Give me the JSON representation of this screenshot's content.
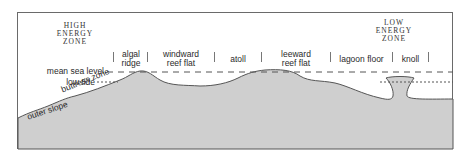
{
  "diagram": {
    "zones": {
      "high_energy": "HIGH\nENERGY\nZONE",
      "low_energy": "LOW\nENERGY\nZONE"
    },
    "levels": {
      "mean_sea_level": "mean sea level",
      "low_tide": "low tide"
    },
    "slope_labels": {
      "buttress_zone": "buttress zone",
      "outer_slope": "outer slope"
    },
    "sections": [
      {
        "label_line1": "algal",
        "label_line2": "ridge"
      },
      {
        "label_line1": "windward",
        "label_line2": "reef flat"
      },
      {
        "label_line1": "atoll",
        "label_line2": ""
      },
      {
        "label_line1": "leeward",
        "label_line2": "reef flat"
      },
      {
        "label_line1": "lagoon floor",
        "label_line2": ""
      },
      {
        "label_line1": "knoll",
        "label_line2": ""
      }
    ],
    "colors": {
      "reef_fill": "#cfcfcf",
      "outline": "#555555",
      "frame": "#6a6a6a"
    }
  }
}
